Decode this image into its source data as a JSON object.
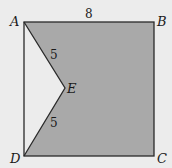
{
  "diagram": {
    "colors": {
      "background": "#ececec",
      "fill": "#a9a9a9",
      "stroke": "#2a2a2a"
    },
    "points": {
      "A": {
        "label": "A",
        "x": 24,
        "y": 22
      },
      "B": {
        "label": "B",
        "x": 154,
        "y": 22
      },
      "C": {
        "label": "C",
        "x": 154,
        "y": 156
      },
      "D": {
        "label": "D",
        "x": 24,
        "y": 156
      },
      "E": {
        "label": "E",
        "x": 65,
        "y": 88
      }
    },
    "lengths": {
      "AB": "8",
      "AE": "5",
      "ED": "5"
    }
  }
}
